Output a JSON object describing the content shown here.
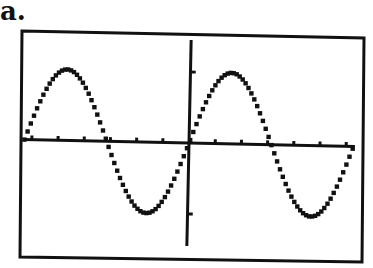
{
  "figure_label": "a.",
  "chart_data": {
    "type": "line",
    "title": "",
    "style": "graphing-calculator screen",
    "function": "y = sin(x)",
    "xlabel": "",
    "ylabel": "",
    "xlim": [
      -6.2832,
      6.2832
    ],
    "ylim": [
      -1.5,
      1.5
    ],
    "x_tick_spacing": 1,
    "y_tick_spacing": 1,
    "x_ticks": [
      -6,
      -5,
      -4,
      -3,
      -2,
      -1,
      1,
      2,
      3,
      4,
      5,
      6
    ],
    "y_ticks": [
      -1,
      1
    ],
    "grid": false,
    "legend": null,
    "series": [
      {
        "name": "sin(x)",
        "x": [
          -6.2832,
          -5.4978,
          -4.7124,
          -3.927,
          -3.1416,
          -2.3562,
          -1.5708,
          -0.7854,
          0,
          0.7854,
          1.5708,
          2.3562,
          3.1416,
          3.927,
          4.7124,
          5.4978,
          6.2832
        ],
        "values": [
          0,
          0.7071,
          1,
          0.7071,
          0,
          -0.7071,
          -1,
          -0.7071,
          0,
          0.7071,
          1,
          0.7071,
          0,
          -0.7071,
          -1,
          -0.7071,
          0
        ]
      }
    ],
    "annotations": []
  },
  "colors": {
    "ink": "#111111",
    "background": "#ffffff"
  }
}
